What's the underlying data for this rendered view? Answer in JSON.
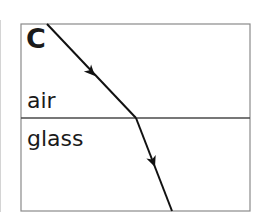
{
  "diagram": {
    "panel_label": "C",
    "media": {
      "upper": "air",
      "lower": "glass"
    },
    "box": {
      "x": 21,
      "y": 24,
      "width": 229,
      "height": 187
    },
    "interface_y": 118,
    "ray": {
      "incident": {
        "x1": 47,
        "y1": 24,
        "x2": 136,
        "y2": 118
      },
      "refracted": {
        "x1": 136,
        "y1": 118,
        "x2": 172,
        "y2": 211
      },
      "arrows": [
        {
          "x": 95,
          "y": 74,
          "segment": "incident"
        },
        {
          "x": 154,
          "y": 165,
          "segment": "refracted"
        }
      ]
    },
    "colors": {
      "box_stroke": "#8a8a8a",
      "interface_stroke": "#4a4a4a",
      "ray_stroke": "#111111",
      "text": "#1a1a1a"
    }
  }
}
